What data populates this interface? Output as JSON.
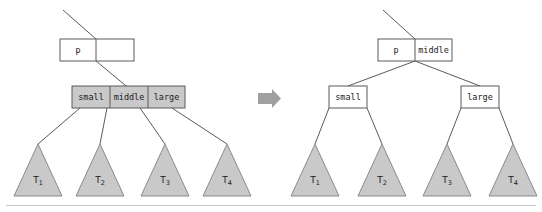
{
  "figure": {
    "transition_icon": "right-arrow-icon",
    "colors": {
      "node_fill_gray": "#c9c9c9",
      "node_fill_white": "#ffffff",
      "stroke": "#5a5a5a",
      "subtree_fill": "#c9c9c9",
      "subtree_stroke": "#8a8a8a",
      "arrow": "#a0a0a0",
      "rule": "#c4c4c4",
      "text": "#1a1a1a"
    }
  },
  "before": {
    "parent_node": {
      "name": "parent-node-before",
      "cells": [
        {
          "label": "p",
          "filled": false
        },
        {
          "label": "",
          "filled": false
        }
      ]
    },
    "child_node": {
      "name": "overfull-child-node",
      "cells": [
        {
          "label": "small",
          "filled": true
        },
        {
          "label": "middle",
          "filled": true
        },
        {
          "label": "large",
          "filled": true
        }
      ]
    },
    "subtrees": [
      {
        "base": "T",
        "sub": "1"
      },
      {
        "base": "T",
        "sub": "2"
      },
      {
        "base": "T",
        "sub": "3"
      },
      {
        "base": "T",
        "sub": "4"
      }
    ]
  },
  "after": {
    "parent_node": {
      "name": "parent-node-after",
      "cells": [
        {
          "label": "p",
          "filled": false
        },
        {
          "label": "middle",
          "filled": false
        }
      ]
    },
    "child_left": {
      "name": "split-child-left",
      "cells": [
        {
          "label": "small",
          "filled": false
        }
      ]
    },
    "child_right": {
      "name": "split-child-right",
      "cells": [
        {
          "label": "large",
          "filled": false
        }
      ]
    },
    "subtrees": [
      {
        "base": "T",
        "sub": "1"
      },
      {
        "base": "T",
        "sub": "2"
      },
      {
        "base": "T",
        "sub": "3"
      },
      {
        "base": "T",
        "sub": "4"
      }
    ]
  }
}
